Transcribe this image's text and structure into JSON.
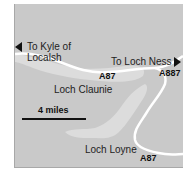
{
  "map": {
    "colors": {
      "land": "#c9c9c9",
      "loch": "#dcdcdc",
      "road": "#ffffff",
      "text": "#222222"
    },
    "destinations": {
      "west": {
        "line1": "To Kyle of",
        "line2": "Localsh",
        "icon": "arrow-left-icon"
      },
      "east": {
        "label": "To Loch Ness",
        "icon": "arrow-right-icon"
      }
    },
    "lochs": [
      {
        "name": "Loch Claunie"
      },
      {
        "name": "Loch Loyne"
      }
    ],
    "roads": [
      {
        "label": "A87"
      },
      {
        "label": "A887"
      },
      {
        "label": "A87"
      }
    ],
    "scale": {
      "label": "4 miles"
    }
  }
}
